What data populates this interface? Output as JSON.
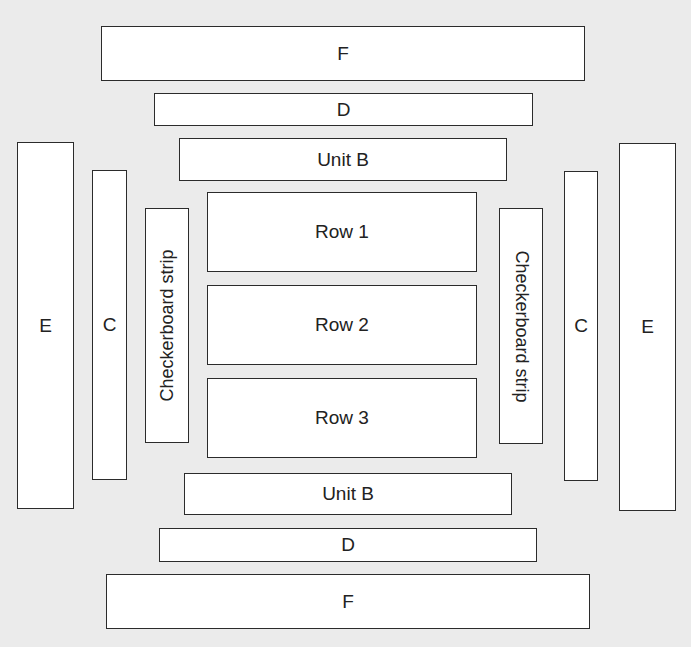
{
  "diagram": {
    "colors": {
      "background": "#ebebeb",
      "box_fill": "#ffffff",
      "box_stroke": "#2b2b2b"
    },
    "top": {
      "f": {
        "label": "F"
      },
      "d": {
        "label": "D"
      },
      "unit_b": {
        "label": "Unit B"
      }
    },
    "rows": [
      {
        "label": "Row 1"
      },
      {
        "label": "Row 2"
      },
      {
        "label": "Row 3"
      }
    ],
    "left": {
      "e": {
        "label": "E"
      },
      "c": {
        "label": "C"
      },
      "checkerboard": {
        "label": "Checkerboard strip"
      }
    },
    "right": {
      "checkerboard": {
        "label": "Checkerboard strip"
      },
      "c": {
        "label": "C"
      },
      "e": {
        "label": "E"
      }
    },
    "bottom": {
      "unit_b": {
        "label": "Unit B"
      },
      "d": {
        "label": "D"
      },
      "f": {
        "label": "F"
      }
    }
  }
}
